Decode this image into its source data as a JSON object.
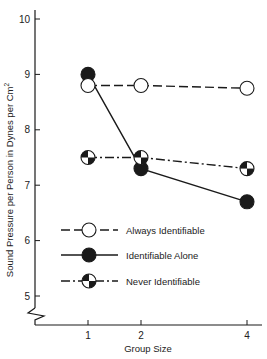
{
  "chart_data": {
    "type": "line",
    "title": "",
    "xlabel": "Group Size",
    "ylabel": "Sound Pressure per Person in Dynes per Cm²",
    "x": [
      1,
      2,
      4
    ],
    "x_tick_labels": [
      "1",
      "2",
      "4"
    ],
    "y_tick_labels": [
      "5",
      "6",
      "7",
      "8",
      "9",
      "10"
    ],
    "ylim": [
      5,
      10
    ],
    "y_axis_break": true,
    "grid": false,
    "legend_position": "lower-left inside plot",
    "series": [
      {
        "name": "Always Identifiable",
        "marker": "open-circle",
        "line_style": "dashed",
        "values": [
          8.8,
          8.8,
          8.75
        ]
      },
      {
        "name": "Identifiable Alone",
        "marker": "filled-circle",
        "line_style": "solid",
        "values": [
          9.0,
          7.3,
          6.7
        ]
      },
      {
        "name": "Never Identifiable",
        "marker": "quartered-circle",
        "line_style": "dash-dot",
        "values": [
          7.5,
          7.5,
          7.3
        ]
      }
    ]
  },
  "axes": {
    "x_title": "Group Size",
    "y_title": "Sound Pressure per Person in Dynes per Cm",
    "y_title_sup": "2",
    "x_ticks": [
      "1",
      "2",
      "4"
    ],
    "y_ticks": [
      "5",
      "6",
      "7",
      "8",
      "9",
      "10"
    ]
  },
  "legend": {
    "items": [
      {
        "label": "Always Identifiable"
      },
      {
        "label": "Identifiable Alone"
      },
      {
        "label": "Never Identifiable"
      }
    ]
  },
  "colors": {
    "ink": "#1a1a1a",
    "background": "#ffffff"
  }
}
